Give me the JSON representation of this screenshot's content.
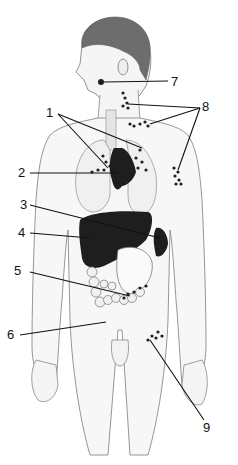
{
  "figure": {
    "type": "anatomical illustration",
    "colors": {
      "ink": "#111111",
      "skin": "#f4f4f4",
      "outline": "#8a8a8a",
      "organ": "#1e1e1e"
    },
    "labels": [
      {
        "id": "1",
        "text": "1",
        "target": "mediastinal / hilar lymph nodes (two leader lines)"
      },
      {
        "id": "2",
        "text": "2",
        "target": "heart / thymus region (dark mass)"
      },
      {
        "id": "3",
        "text": "3",
        "target": "spleen"
      },
      {
        "id": "4",
        "text": "4",
        "target": "liver"
      },
      {
        "id": "5",
        "text": "5",
        "target": "mesenteric lymph nodes"
      },
      {
        "id": "6",
        "text": "6",
        "target": "intestines / lower abdomen"
      },
      {
        "id": "7",
        "text": "7",
        "target": "tonsil / jaw node"
      },
      {
        "id": "8",
        "text": "8",
        "target": "cervical, supraclavicular and axillary lymph nodes (three leader lines)"
      },
      {
        "id": "9",
        "text": "9",
        "target": "inguinal lymph nodes"
      }
    ]
  }
}
